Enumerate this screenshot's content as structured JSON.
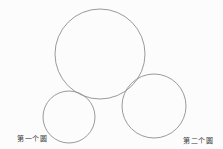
{
  "diagram": {
    "background_color": "#fcfcfc",
    "stroke_color": "#8f8f8f",
    "text_color": "#3c3c3c",
    "circles": {
      "big": {
        "cx": 100,
        "cy": 54,
        "r": 45
      },
      "first": {
        "cx": 69,
        "cy": 117,
        "r": 26
      },
      "second": {
        "cx": 154,
        "cy": 106,
        "r": 32
      }
    },
    "labels": {
      "first": "第一个圆",
      "second": "第二个圆"
    }
  }
}
